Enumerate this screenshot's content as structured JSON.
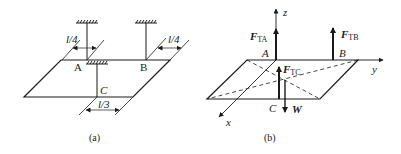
{
  "figure_a": {
    "caption": "(a)",
    "points": {
      "A": "A",
      "B": "B",
      "C": "C"
    },
    "dimensions": {
      "left": "l/4",
      "right": "l/4",
      "bottom": "l/3"
    }
  },
  "figure_b": {
    "caption": "(b)",
    "axes": {
      "x": "x",
      "y": "y",
      "z": "z"
    },
    "points": {
      "A": "A",
      "B": "B",
      "C": "C"
    },
    "forces": {
      "FTA": {
        "main": "F",
        "sub": "TA"
      },
      "FTB": {
        "main": "F",
        "sub": "TB"
      },
      "FTC": {
        "main": "F",
        "sub": "TC"
      },
      "W": {
        "main": "W"
      }
    }
  },
  "colors": {
    "line": "#1a1a1a",
    "background": "#ffffff"
  }
}
